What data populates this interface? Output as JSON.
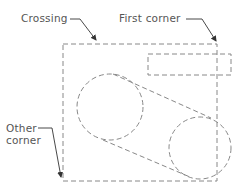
{
  "diagram": {
    "labels": {
      "crossing": "Crossing",
      "first_corner": "First corner",
      "other_corner_line1": "Other",
      "other_corner_line2": "corner"
    },
    "colors": {
      "stroke": "#888888",
      "text": "#555555",
      "background": "#ffffff"
    },
    "shapes": {
      "crossing_window": {
        "x": 63,
        "y": 44,
        "width": 154,
        "height": 137,
        "style": "dashed"
      },
      "small_rectangle": {
        "x": 148,
        "y": 54,
        "width": 83,
        "height": 21,
        "style": "dashed"
      },
      "left_circle": {
        "cx": 110,
        "cy": 107,
        "r": 33,
        "style": "dashed"
      },
      "right_circle": {
        "cx": 200,
        "cy": 148,
        "r": 31,
        "style": "dashed"
      },
      "upper_tangent": {
        "x1": 113,
        "y1": 74,
        "x2": 211,
        "y2": 118
      },
      "lower_tangent": {
        "x1": 103,
        "y1": 140,
        "x2": 190,
        "y2": 177
      }
    }
  }
}
